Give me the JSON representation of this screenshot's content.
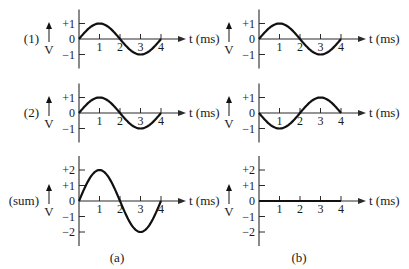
{
  "chart_data": [
    {
      "type": "line",
      "panel": "a",
      "row_label": "(1)",
      "ylabel": "V",
      "xlabel": "t (ms)",
      "x_ticks": [
        "1",
        "2",
        "3",
        "4"
      ],
      "y_ticks": [
        "+1",
        "0",
        "−1"
      ],
      "ylim": [
        -1,
        1
      ],
      "xlim": [
        0,
        4
      ],
      "function": "sin",
      "amplitude": 1,
      "phase_deg": 0,
      "period_ms": 4
    },
    {
      "type": "line",
      "panel": "b",
      "row_label": "",
      "ylabel": "V",
      "xlabel": "t (ms)",
      "x_ticks": [
        "1",
        "2",
        "3",
        "4"
      ],
      "y_ticks": [
        "+1",
        "0",
        "−1"
      ],
      "ylim": [
        -1,
        1
      ],
      "xlim": [
        0,
        4
      ],
      "function": "sin",
      "amplitude": 1,
      "phase_deg": 0,
      "period_ms": 4
    },
    {
      "type": "line",
      "panel": "a",
      "row_label": "(2)",
      "ylabel": "V",
      "xlabel": "t (ms)",
      "x_ticks": [
        "1",
        "2",
        "3",
        "4"
      ],
      "y_ticks": [
        "+1",
        "0",
        "−1"
      ],
      "ylim": [
        -1,
        1
      ],
      "xlim": [
        0,
        4
      ],
      "function": "sin",
      "amplitude": 1,
      "phase_deg": 0,
      "period_ms": 4
    },
    {
      "type": "line",
      "panel": "b",
      "row_label": "",
      "ylabel": "V",
      "xlabel": "t (ms)",
      "x_ticks": [
        "1",
        "2",
        "3",
        "4"
      ],
      "y_ticks": [
        "+1",
        "0",
        "−1"
      ],
      "ylim": [
        -1,
        1
      ],
      "xlim": [
        0,
        4
      ],
      "function": "sin",
      "amplitude": 1,
      "phase_deg": 180,
      "period_ms": 4
    },
    {
      "type": "line",
      "panel": "a",
      "row_label": "(sum)",
      "ylabel": "V",
      "xlabel": "t (ms)",
      "x_ticks": [
        "1",
        "2",
        "3",
        "4"
      ],
      "y_ticks": [
        "+2",
        "+1",
        "0",
        "−1",
        "−2"
      ],
      "ylim": [
        -2,
        2
      ],
      "xlim": [
        0,
        4
      ],
      "function": "sin",
      "amplitude": 2,
      "phase_deg": 0,
      "period_ms": 4
    },
    {
      "type": "line",
      "panel": "b",
      "row_label": "",
      "ylabel": "V",
      "xlabel": "t (ms)",
      "x_ticks": [
        "1",
        "2",
        "3",
        "4"
      ],
      "y_ticks": [
        "+2",
        "+1",
        "0",
        "−1",
        "−2"
      ],
      "ylim": [
        -2,
        2
      ],
      "xlim": [
        0,
        4
      ],
      "function": "sin",
      "amplitude": 0,
      "phase_deg": 0,
      "period_ms": 4
    }
  ],
  "captions": {
    "a": "(a)",
    "b": "(b)"
  },
  "colors": {
    "wave": "#111111",
    "axis": "#2a2a2a",
    "text": "#1a1a1a"
  }
}
